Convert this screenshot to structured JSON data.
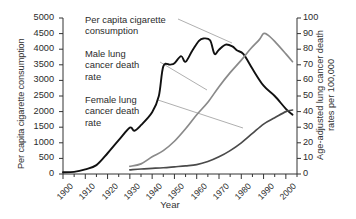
{
  "chart_data": {
    "type": "line",
    "title": "",
    "xlabel": "Year",
    "ylabel": "Per capita cigarette consumption",
    "ylabel_right": "Age-adjusted lung cancer death rates per 100,000",
    "xlim": [
      1900,
      2005
    ],
    "ylim_left": [
      0,
      5000
    ],
    "ylim_right": [
      0,
      100
    ],
    "grid": false,
    "legend_position": "inline-annotations",
    "xticks": [
      "1900",
      "1910",
      "1920",
      "1930",
      "1940",
      "1950",
      "1960",
      "1970",
      "1980",
      "1990",
      "2000"
    ],
    "yticks_left": [
      "0",
      "500",
      "1000",
      "1500",
      "2000",
      "2500",
      "3000",
      "3500",
      "4000",
      "4500",
      "5000"
    ],
    "yticks_right": [
      "0",
      "10",
      "20",
      "30",
      "40",
      "50",
      "60",
      "70",
      "80",
      "90",
      "100"
    ],
    "colors": {
      "cigarettes": "#111111",
      "male": "#8a8a8a",
      "female": "#4a4a4a"
    },
    "series": [
      {
        "name": "Per capita cigarette consumption",
        "axis": "left",
        "color": "#111111",
        "x": [
          1900,
          1905,
          1910,
          1915,
          1920,
          1925,
          1930,
          1932,
          1935,
          1940,
          1943,
          1945,
          1948,
          1950,
          1953,
          1955,
          1958,
          1961,
          1963,
          1966,
          1968,
          1970,
          1973,
          1976,
          1978,
          1981,
          1985,
          1990,
          1995,
          2000,
          2003
        ],
        "values": [
          54,
          70,
          151,
          285,
          665,
          1085,
          1485,
          1385,
          1564,
          1976,
          2500,
          3449,
          3505,
          3552,
          3778,
          3597,
          3953,
          4266,
          4345,
          4287,
          3851,
          3985,
          4148,
          4092,
          3965,
          3840,
          3370,
          2830,
          2500,
          2090,
          1900
        ]
      },
      {
        "name": "Male lung cancer death rate",
        "axis": "right",
        "color": "#8a8a8a",
        "x": [
          1930,
          1935,
          1940,
          1945,
          1950,
          1955,
          1960,
          1965,
          1970,
          1975,
          1980,
          1984,
          1988,
          1990,
          1992,
          1995,
          2000,
          2003
        ],
        "values": [
          4.9,
          6.5,
          11,
          15,
          21,
          29,
          38,
          46,
          56,
          65,
          73,
          80,
          86,
          90,
          89,
          85,
          77,
          72
        ]
      },
      {
        "name": "Female lung cancer death rate",
        "axis": "right",
        "color": "#4a4a4a",
        "x": [
          1930,
          1935,
          1940,
          1945,
          1950,
          1955,
          1960,
          1965,
          1970,
          1975,
          1980,
          1985,
          1990,
          1995,
          2000,
          2003
        ],
        "values": [
          2.6,
          3.2,
          3.6,
          4.0,
          4.6,
          5.2,
          6.0,
          8.0,
          11,
          15,
          20,
          26,
          32,
          36,
          40,
          41
        ]
      }
    ],
    "annotations": [
      {
        "id": "cigarettes",
        "text": "Per capita cigarette\nconsumption"
      },
      {
        "id": "male",
        "text": "Male lung\ncancer death\nrate"
      },
      {
        "id": "female",
        "text": "Female lung\ncancer death\nrate"
      }
    ]
  }
}
